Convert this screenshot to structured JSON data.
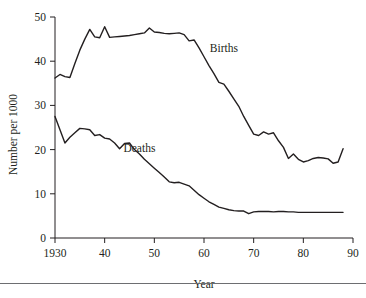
{
  "chart_data": {
    "type": "line",
    "title": "",
    "subtitle": "",
    "xlabel": "Year",
    "ylabel": "Number per 1000",
    "xlim": [
      1930,
      1990
    ],
    "ylim": [
      0,
      50
    ],
    "grid": false,
    "legend_position": "inline-annotation",
    "x_tick_labels": [
      "1930",
      "40",
      "50",
      "60",
      "70",
      "80",
      "90"
    ],
    "x_tick_values": [
      1930,
      1940,
      1950,
      1960,
      1970,
      1980,
      1990
    ],
    "y_tick_labels": [
      "0",
      "10",
      "20",
      "30",
      "40",
      "50"
    ],
    "y_tick_values": [
      0,
      10,
      20,
      30,
      40,
      50
    ],
    "annotations": [
      {
        "text": "Births",
        "x": 1964,
        "y": 42.0
      },
      {
        "text": "Deaths",
        "x": 1947,
        "y": 19.5
      }
    ],
    "x": [
      1930,
      1931,
      1932,
      1933,
      1934,
      1935,
      1936,
      1937,
      1938,
      1939,
      1940,
      1941,
      1942,
      1943,
      1944,
      1945,
      1946,
      1947,
      1948,
      1949,
      1950,
      1951,
      1952,
      1953,
      1954,
      1955,
      1956,
      1957,
      1958,
      1959,
      1960,
      1961,
      1962,
      1963,
      1964,
      1965,
      1966,
      1967,
      1968,
      1969,
      1970,
      1971,
      1972,
      1973,
      1974,
      1975,
      1976,
      1977,
      1978,
      1979,
      1980,
      1981,
      1982,
      1983,
      1984,
      1985,
      1986,
      1987,
      1988
    ],
    "series": [
      {
        "name": "Births",
        "values": [
          36.2,
          37.0,
          36.5,
          36.3,
          39.5,
          42.5,
          45.0,
          47.2,
          45.5,
          45.3,
          47.8,
          45.4,
          45.5,
          45.6,
          45.7,
          45.8,
          46.0,
          46.2,
          46.4,
          47.5,
          46.6,
          46.5,
          46.3,
          46.2,
          46.3,
          46.4,
          46.0,
          44.6,
          44.8,
          43.0,
          41.0,
          39.0,
          37.2,
          35.2,
          34.8,
          33.2,
          31.5,
          29.8,
          27.5,
          25.5,
          23.5,
          23.2,
          24.0,
          23.5,
          23.8,
          22.0,
          20.5,
          18.0,
          19.0,
          17.8,
          17.2,
          17.5,
          18.0,
          18.2,
          18.1,
          17.9,
          16.9,
          17.2,
          20.2
        ]
      },
      {
        "name": "Deaths",
        "values": [
          27.5,
          24.5,
          21.5,
          22.8,
          23.8,
          24.8,
          24.7,
          24.5,
          23.2,
          23.4,
          22.6,
          22.4,
          21.5,
          20.2,
          21.4,
          21.5,
          20.0,
          19.0,
          17.8,
          16.8,
          15.8,
          14.8,
          13.8,
          12.7,
          12.5,
          12.6,
          12.2,
          11.8,
          10.8,
          9.8,
          9.0,
          8.2,
          7.6,
          7.0,
          6.7,
          6.4,
          6.2,
          6.1,
          6.1,
          5.5,
          5.9,
          6.0,
          6.0,
          6.0,
          5.9,
          6.0,
          6.0,
          5.9,
          5.9,
          5.8,
          5.8,
          5.8,
          5.8,
          5.8,
          5.8,
          5.8,
          5.8,
          5.8,
          5.8
        ]
      }
    ]
  },
  "axes": {
    "y_label": "Number per 1000",
    "x_label": "Year"
  }
}
